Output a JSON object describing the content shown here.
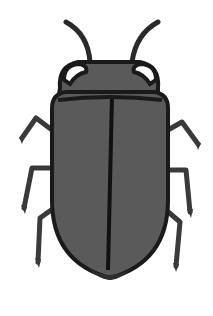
{
  "image": {
    "subject": "beetle illustration",
    "colors": {
      "background": "#ffffff",
      "body_fill": "#5a5a5a",
      "outline": "#1a1a1a",
      "leg": "#3a3a3a",
      "eye_fill": "#ffffff"
    }
  }
}
